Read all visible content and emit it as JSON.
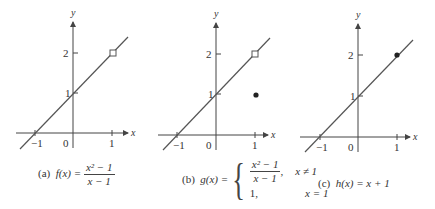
{
  "figures": [
    {
      "id": "a",
      "caption": {
        "prefix": "(a)",
        "lhs": "f(x) =",
        "numerator": "x² − 1",
        "denominator": "x − 1"
      },
      "axes": {
        "x_label": "x",
        "y_label": "y",
        "x_ticks": [
          "−1",
          "0",
          "1"
        ],
        "y_ticks": [
          "1",
          "2"
        ]
      },
      "line": "y = x + 1",
      "special_point": {
        "x": 1,
        "y": 2,
        "style": "open-circle"
      }
    },
    {
      "id": "b",
      "caption": {
        "prefix": "(b)",
        "lhs": "g(x) =",
        "case1_numerator": "x² − 1",
        "case1_denominator": "x − 1",
        "case1_condition": "x ≠ 1",
        "case2_value": "1,",
        "case2_condition": "x = 1"
      },
      "axes": {
        "x_label": "x",
        "y_label": "y",
        "x_ticks": [
          "−1",
          "0",
          "1"
        ],
        "y_ticks": [
          "1",
          "2"
        ]
      },
      "line": "y = x + 1",
      "special_points": [
        {
          "x": 1,
          "y": 2,
          "style": "open-circle"
        },
        {
          "x": 1,
          "y": 1,
          "style": "filled-dot"
        }
      ]
    },
    {
      "id": "c",
      "caption": {
        "prefix": "(c)",
        "lhs": "h(x) = x + 1"
      },
      "axes": {
        "x_label": "x",
        "y_label": "y",
        "x_ticks": [
          "−1",
          "0",
          "1"
        ],
        "y_ticks": [
          "1",
          "2"
        ]
      },
      "line": "y = x + 1",
      "special_point": {
        "x": 1,
        "y": 2,
        "style": "filled-dot"
      }
    }
  ],
  "colors": {
    "line": "#555555",
    "axis": "#444444",
    "text": "#333333"
  }
}
